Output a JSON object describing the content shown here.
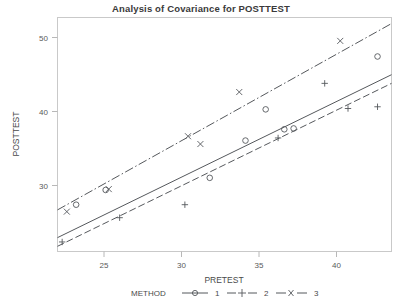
{
  "chart_data": {
    "type": "scatter",
    "title": "Analysis of Covariance for POSTTEST",
    "xlabel": "PRETEST",
    "ylabel": "POSTTEST",
    "xlim": [
      22,
      43.5
    ],
    "ylim": [
      24.5,
      51.5
    ],
    "xticks": [
      25,
      30,
      35,
      40
    ],
    "yticks": [
      30,
      40,
      50
    ],
    "grid": false,
    "legend_title": "METHOD",
    "legend_position": "bottom",
    "series": [
      {
        "name": "1",
        "marker": "circle",
        "line_style": "solid",
        "points": [
          {
            "x": 23.2,
            "y": 29.9
          },
          {
            "x": 25.1,
            "y": 31.6
          },
          {
            "x": 31.8,
            "y": 33.0
          },
          {
            "x": 34.1,
            "y": 37.3
          },
          {
            "x": 35.4,
            "y": 40.9
          },
          {
            "x": 36.6,
            "y": 38.6
          },
          {
            "x": 37.2,
            "y": 38.7
          },
          {
            "x": 42.6,
            "y": 47.0
          }
        ],
        "fit_line": {
          "x1": 22.0,
          "y1": 26.1,
          "x2": 43.5,
          "y2": 44.9
        }
      },
      {
        "name": "2",
        "marker": "plus",
        "line_style": "dashed",
        "points": [
          {
            "x": 22.3,
            "y": 25.6
          },
          {
            "x": 26.0,
            "y": 28.4
          },
          {
            "x": 30.2,
            "y": 29.9
          },
          {
            "x": 36.2,
            "y": 37.6
          },
          {
            "x": 39.2,
            "y": 43.9
          },
          {
            "x": 40.7,
            "y": 41.0
          },
          {
            "x": 42.6,
            "y": 41.2
          }
        ],
        "fit_line": {
          "x1": 22.0,
          "y1": 25.1,
          "x2": 43.5,
          "y2": 43.9
        }
      },
      {
        "name": "3",
        "marker": "x",
        "line_style": "dash-dot",
        "points": [
          {
            "x": 22.6,
            "y": 29.1
          },
          {
            "x": 25.3,
            "y": 31.7
          },
          {
            "x": 30.4,
            "y": 37.8
          },
          {
            "x": 31.2,
            "y": 36.9
          },
          {
            "x": 33.7,
            "y": 42.9
          },
          {
            "x": 40.2,
            "y": 48.8
          }
        ],
        "fit_line": {
          "x1": 22.0,
          "y1": 29.3,
          "x2": 43.5,
          "y2": 50.8
        }
      }
    ]
  },
  "axis": {
    "x_tick_labels": [
      "25",
      "30",
      "35",
      "40"
    ],
    "y_tick_labels": [
      "30",
      "40",
      "50"
    ],
    "x_title": "PRETEST",
    "y_title": "POSTTEST"
  },
  "legend": {
    "title": "METHOD",
    "items": [
      {
        "label": "1",
        "marker": "circle-marker",
        "line": "solid-line"
      },
      {
        "label": "2",
        "marker": "plus-marker",
        "line": "dashed-line"
      },
      {
        "label": "3",
        "marker": "x-marker",
        "line": "dash-dot-line"
      }
    ]
  },
  "colors": {
    "ink": "#55585c",
    "frame": "#c9c9c9",
    "text": "#3b3b3b",
    "background": "#ffffff"
  }
}
